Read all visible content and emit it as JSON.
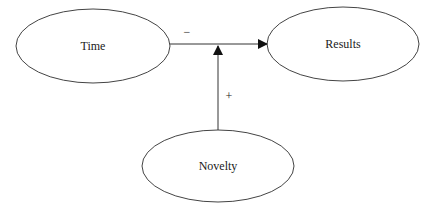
{
  "diagram": {
    "type": "moderation-model",
    "nodes": [
      {
        "id": "time",
        "label": "Time",
        "cx": 93,
        "cy": 46,
        "rx": 77,
        "ry": 37
      },
      {
        "id": "results",
        "label": "Results",
        "cx": 343,
        "cy": 44,
        "rx": 76,
        "ry": 37
      },
      {
        "id": "novelty",
        "label": "Novelty",
        "cx": 218,
        "cy": 166,
        "rx": 76,
        "ry": 36
      }
    ],
    "edges": [
      {
        "from": "time",
        "to": "results",
        "sign": "−"
      },
      {
        "from": "novelty",
        "to": "time-results-path",
        "sign": "+"
      }
    ],
    "colors": {
      "stroke": "#333333",
      "text": "#1a1a1a",
      "background": "#ffffff"
    }
  }
}
